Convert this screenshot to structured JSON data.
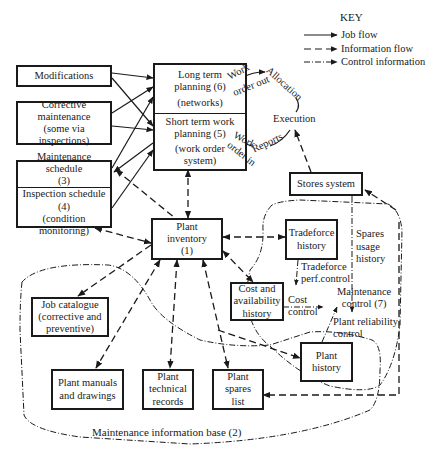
{
  "key": {
    "title": "KEY",
    "items": [
      {
        "line": "solid",
        "label": "Job flow"
      },
      {
        "line": "dashed",
        "label": "Information flow"
      },
      {
        "line": "dash-dot",
        "label": "Control information"
      }
    ]
  },
  "boxes": {
    "modifications": [
      "Modifications"
    ],
    "corrective": [
      "Corrective",
      "maintenance",
      "(some via inspections)"
    ],
    "maint_schedule": [
      "Maintenance schedule",
      "(3)"
    ],
    "inspection_schedule": [
      "Inspection schedule",
      "(4)",
      "(condition monitoring)"
    ],
    "long_term": [
      "Long term",
      "planning (6)",
      "(networks)"
    ],
    "short_term": [
      "Short term work",
      "planning (5)",
      "(work order",
      "system)"
    ],
    "plant_inventory": [
      "Plant",
      "inventory",
      "(1)"
    ],
    "stores_system": [
      "Stores system"
    ],
    "tradeforce_history": [
      "Tradeforce",
      "history"
    ],
    "cost_availability": [
      "Cost and",
      "availability",
      "history"
    ],
    "plant_history": [
      "Plant",
      "history"
    ],
    "job_catalogue": [
      "Job catalogue",
      "(corrective and",
      "preventive)"
    ],
    "plant_manuals": [
      "Plant manuals",
      "and drawings"
    ],
    "plant_technical": [
      "Plant",
      "technical",
      "records"
    ],
    "plant_spares": [
      "Plant",
      "spares",
      "list"
    ]
  },
  "labels": {
    "work_order_out_1": "Work",
    "work_order_out_2": "order out",
    "allocation": "Allocation",
    "execution": "Execution",
    "reports": "Reports",
    "work_order_in_1": "Work",
    "work_order_in_2": "order in",
    "spares_usage_1": "Spares",
    "spares_usage_2": "usage",
    "spares_usage_3": "history",
    "tradeforce_perf_1": "Tradeforce",
    "tradeforce_perf_2": "perf.control",
    "cost_control_1": "Cost",
    "cost_control_2": "control",
    "maintenance_control_1": "Maintenance",
    "maintenance_control_2": "control (7)",
    "plant_reliability_1": "Plant reliability",
    "plant_reliability_2": "control",
    "maintenance_info_base": "Maintenance information base (2)"
  }
}
